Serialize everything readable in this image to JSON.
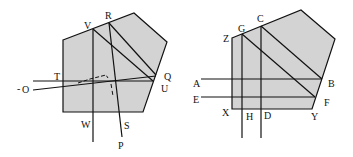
{
  "diagram_left": {
    "labels": {
      "V": "V",
      "R": "R",
      "T": "T",
      "O": "O",
      "Q": "Q",
      "U": "U",
      "W": "W",
      "S": "S",
      "P": "P",
      "O_prefix": "-"
    }
  },
  "diagram_right": {
    "labels": {
      "Z": "Z",
      "G": "G",
      "C": "C",
      "A": "A",
      "B": "B",
      "E": "E",
      "F": "F",
      "X": "X",
      "H": "H",
      "D": "D",
      "Y": "Y"
    }
  },
  "colors": {
    "fill": "#d3d3d3",
    "stroke": "#111111"
  }
}
